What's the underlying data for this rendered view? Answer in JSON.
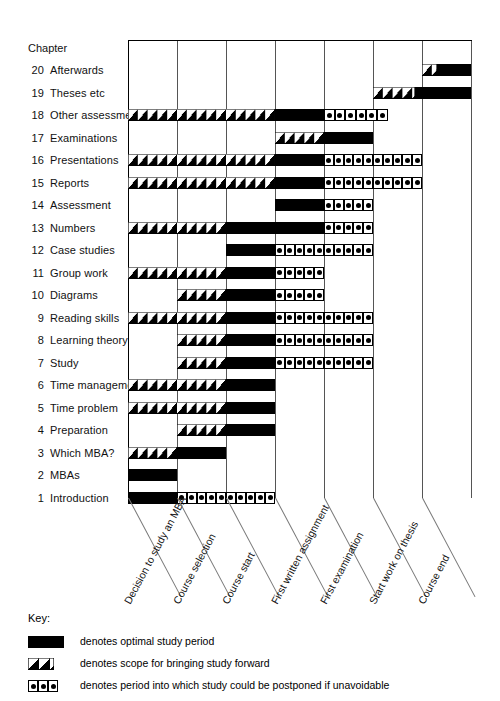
{
  "chart_title_label": "Chapter",
  "key": {
    "title": "Key:",
    "entries": [
      {
        "symbol": "solid",
        "text": "denotes optimal study period"
      },
      {
        "symbol": "hatch",
        "text": "denotes scope for bringing study forward"
      },
      {
        "symbol": "dots",
        "text": "denotes period into which study could be postponed if unavoidable"
      }
    ]
  },
  "chart_data": {
    "type": "bar",
    "title": "Chapter",
    "xlabel": "",
    "ylabel": "Chapter",
    "grid": true,
    "legend_position": "below",
    "milestones": [
      "Decision to study an MBA",
      "Course selection",
      "Course start",
      "First written assignment",
      "First examination",
      "Start work on thesis",
      "Course end"
    ],
    "milestone_positions": [
      0,
      1,
      2,
      3,
      4,
      5,
      6
    ],
    "xlim": [
      0,
      7
    ],
    "segment_types": [
      "hatch",
      "solid",
      "dots"
    ],
    "categories": [
      "20 Afterwards",
      "19 Theses etc",
      "18 Other assessment",
      "17 Examinations",
      "16 Presentations",
      "15 Reports",
      "14 Assessment",
      "13 Numbers",
      "12 Case studies",
      "11 Group work",
      "10 Diagrams",
      "9 Reading skills",
      "8 Learning theory",
      "7 Study",
      "6 Time management",
      "5 Time problem",
      "4 Preparation",
      "3 Which MBA?",
      "2 MBAs",
      "1 Introduction"
    ],
    "rows": [
      {
        "num": "20",
        "label": "Afterwards",
        "hatch": [
          6.0,
          6.3
        ],
        "solid": [
          6.3,
          7.0
        ],
        "dots": null
      },
      {
        "num": "19",
        "label": "Theses etc",
        "hatch": [
          5.0,
          5.85
        ],
        "solid": [
          5.85,
          7.0
        ],
        "dots": null
      },
      {
        "num": "18",
        "label": "Other assessment",
        "hatch": [
          0.0,
          3.0
        ],
        "solid": [
          3.0,
          4.0
        ],
        "dots": [
          4.0,
          5.3
        ]
      },
      {
        "num": "17",
        "label": "Examinations",
        "hatch": [
          3.0,
          4.0
        ],
        "solid": [
          4.0,
          5.0
        ],
        "dots": null
      },
      {
        "num": "16",
        "label": "Presentations",
        "hatch": [
          0.0,
          3.0
        ],
        "solid": [
          3.0,
          4.0
        ],
        "dots": [
          4.0,
          6.0
        ]
      },
      {
        "num": "15",
        "label": "Reports",
        "hatch": [
          0.0,
          3.0
        ],
        "solid": [
          3.0,
          4.0
        ],
        "dots": [
          4.0,
          6.0
        ]
      },
      {
        "num": "14",
        "label": "Assessment",
        "hatch": null,
        "solid": [
          3.0,
          4.0
        ],
        "dots": [
          4.0,
          5.0
        ]
      },
      {
        "num": "13",
        "label": "Numbers",
        "hatch": [
          0.0,
          2.0
        ],
        "solid": [
          2.0,
          4.0
        ],
        "dots": [
          4.0,
          5.0
        ]
      },
      {
        "num": "12",
        "label": "Case studies",
        "hatch": null,
        "solid": [
          2.0,
          3.0
        ],
        "dots": [
          3.0,
          5.0
        ]
      },
      {
        "num": "11",
        "label": "Group work",
        "hatch": [
          0.0,
          2.0
        ],
        "solid": [
          2.0,
          3.0
        ],
        "dots": [
          3.0,
          4.0
        ]
      },
      {
        "num": "10",
        "label": "Diagrams",
        "hatch": [
          1.0,
          2.0
        ],
        "solid": [
          2.0,
          3.0
        ],
        "dots": [
          3.0,
          4.0
        ]
      },
      {
        "num": "9",
        "label": "Reading skills",
        "hatch": [
          0.0,
          2.0
        ],
        "solid": [
          2.0,
          3.0
        ],
        "dots": [
          3.0,
          5.0
        ]
      },
      {
        "num": "8",
        "label": "Learning theory",
        "hatch": [
          1.0,
          2.0
        ],
        "solid": [
          2.0,
          3.0
        ],
        "dots": [
          3.0,
          5.0
        ]
      },
      {
        "num": "7",
        "label": "Study",
        "hatch": [
          1.0,
          2.0
        ],
        "solid": [
          2.0,
          3.0
        ],
        "dots": [
          3.0,
          5.0
        ]
      },
      {
        "num": "6",
        "label": "Time management",
        "hatch": [
          0.0,
          2.0
        ],
        "solid": [
          2.0,
          3.0
        ],
        "dots": null
      },
      {
        "num": "5",
        "label": "Time problem",
        "hatch": [
          0.0,
          2.0
        ],
        "solid": [
          2.0,
          3.0
        ],
        "dots": null
      },
      {
        "num": "4",
        "label": "Preparation",
        "hatch": [
          1.0,
          2.0
        ],
        "solid": [
          2.0,
          3.0
        ],
        "dots": null
      },
      {
        "num": "3",
        "label": "Which MBA?",
        "hatch": [
          0.0,
          1.0
        ],
        "solid": [
          1.0,
          2.0
        ],
        "dots": null
      },
      {
        "num": "2",
        "label": "MBAs",
        "hatch": null,
        "solid": [
          0.0,
          1.0
        ],
        "dots": null
      },
      {
        "num": "1",
        "label": "Introduction",
        "hatch": null,
        "solid": [
          0.0,
          1.0
        ],
        "dots": [
          1.0,
          3.0
        ]
      }
    ]
  }
}
